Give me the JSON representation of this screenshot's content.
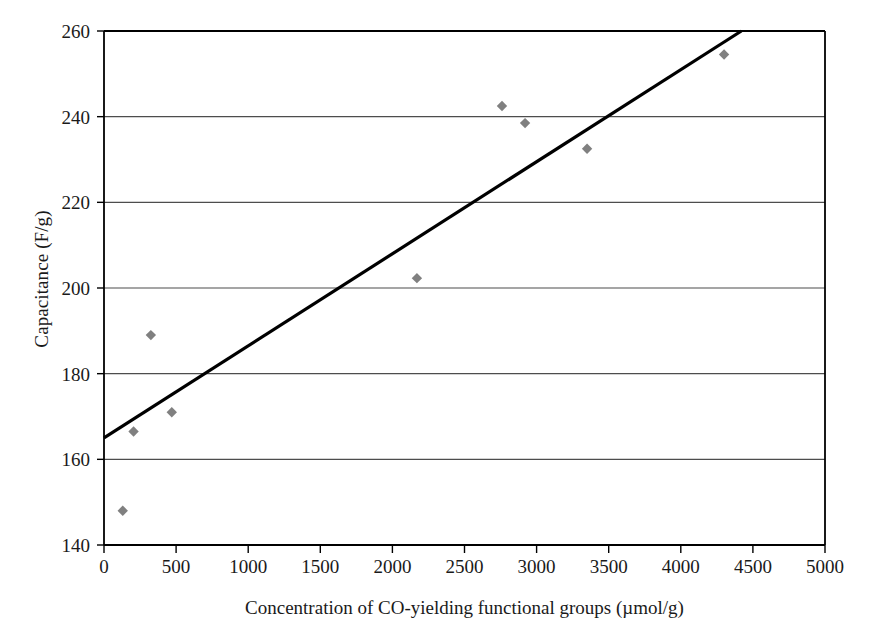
{
  "chart_data": {
    "type": "scatter",
    "title": "",
    "xlabel": "Concentration of CO-yielding functional groups (µmol/g)",
    "ylabel": "Capacitance (F/g)",
    "xlim": [
      0,
      5000
    ],
    "ylim": [
      140,
      260
    ],
    "xticks": [
      0,
      500,
      1000,
      1500,
      2000,
      2500,
      3000,
      3500,
      4000,
      4500,
      5000
    ],
    "yticks": [
      140,
      160,
      180,
      200,
      220,
      240,
      260
    ],
    "xtick_labels": [
      "0",
      "500",
      "1000",
      "1500",
      "2000",
      "2500",
      "3000",
      "3500",
      "4000",
      "4500",
      "5000"
    ],
    "ytick_labels": [
      "140",
      "160",
      "180",
      "200",
      "220",
      "240",
      "260"
    ],
    "grid": "horizontal",
    "legend": "none",
    "marker": "diamond",
    "marker_color": "#808080",
    "series": [
      {
        "name": "Capacitance vs CO-yielding groups",
        "points": [
          {
            "x": 130,
            "y": 148.0
          },
          {
            "x": 205,
            "y": 166.5
          },
          {
            "x": 325,
            "y": 189.0
          },
          {
            "x": 470,
            "y": 171.0
          },
          {
            "x": 2170,
            "y": 202.3
          },
          {
            "x": 2760,
            "y": 242.5
          },
          {
            "x": 2920,
            "y": 238.5
          },
          {
            "x": 3350,
            "y": 232.5
          },
          {
            "x": 4300,
            "y": 254.5
          }
        ]
      }
    ],
    "trendline": {
      "type": "linear",
      "color": "#000000",
      "x_start": 0,
      "y_start": 165.0,
      "x_end": 4420,
      "y_end": 260.0
    }
  },
  "axes": {
    "frame_color": "#000000",
    "gridline_color": "#4d4d4d",
    "background": "#ffffff"
  }
}
